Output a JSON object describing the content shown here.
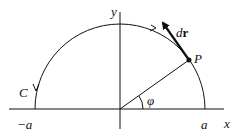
{
  "diagram": {
    "type": "semicircle-path",
    "labels": {
      "y_axis": "y",
      "x_axis": "x",
      "neg_a": "−a",
      "pos_a": "a",
      "curve": "C",
      "point": "P",
      "angle": "φ",
      "vector_d": "d",
      "vector_r": "r"
    },
    "colors": {
      "ink": "#111111",
      "background": "#ffffff"
    }
  }
}
